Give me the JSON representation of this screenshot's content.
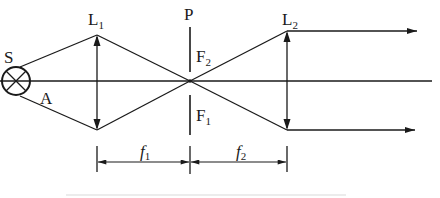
{
  "diagram": {
    "type": "optics-schematic",
    "labels": {
      "source": "S",
      "source_point": "A",
      "lens1": "L",
      "lens1_sub": "1",
      "lens2": "L",
      "lens2_sub": "2",
      "plane": "P",
      "focus_upper": "F",
      "focus_upper_sub": "2",
      "focus_lower": "F",
      "focus_lower_sub": "1",
      "dim1": "f",
      "dim1_sub": "1",
      "dim2": "f",
      "dim2_sub": "2"
    },
    "colors": {
      "stroke": "#1a1a1a",
      "background": "#ffffff"
    }
  }
}
